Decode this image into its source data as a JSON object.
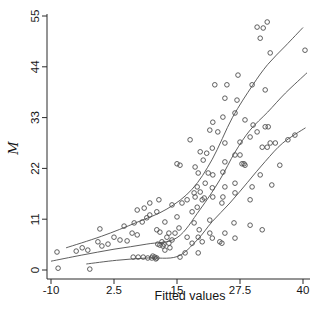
{
  "chart_data": {
    "type": "scatter",
    "title": "",
    "xlabel": "Fitted values",
    "ylabel": "M",
    "xlim": [
      -10,
      40
    ],
    "ylim": [
      0,
      55
    ],
    "x_ticks": [
      -10,
      2.5,
      15,
      27.5,
      40
    ],
    "x_tick_labels": [
      "-10",
      "2.5",
      "15",
      "27.5",
      "40"
    ],
    "y_ticks": [
      0,
      11,
      22,
      33,
      44,
      55
    ],
    "y_tick_labels": [
      "0",
      "11",
      "22",
      "33",
      "44",
      "55"
    ],
    "grid": false,
    "legend_position": "none",
    "marker_shape": "open-circle",
    "marker_color": "#4d4d4d",
    "line_color": "#4d4d4d",
    "axis_color": "#2b2b2b",
    "background_color": "#ffffff",
    "points": [
      [
        -8.8,
        3.9
      ],
      [
        -8.6,
        0.4
      ],
      [
        -5.0,
        4.1
      ],
      [
        -3.8,
        4.8
      ],
      [
        -2.7,
        4.3
      ],
      [
        -2.3,
        0.2
      ],
      [
        -0.7,
        6.1
      ],
      [
        -0.3,
        8.9
      ],
      [
        0.1,
        5.2
      ],
      [
        1.3,
        5.6
      ],
      [
        2.5,
        7.1
      ],
      [
        3.7,
        6.5
      ],
      [
        4.5,
        9.5
      ],
      [
        5.1,
        6.3
      ],
      [
        6.1,
        8.0
      ],
      [
        6.3,
        2.8
      ],
      [
        6.5,
        10.2
      ],
      [
        7.1,
        7.6
      ],
      [
        7.1,
        13.0
      ],
      [
        7.3,
        2.8
      ],
      [
        8.1,
        10.4
      ],
      [
        8.3,
        2.8
      ],
      [
        8.5,
        13.4
      ],
      [
        9.0,
        11.3
      ],
      [
        9.2,
        2.6
      ],
      [
        9.6,
        11.9
      ],
      [
        9.6,
        14.5
      ],
      [
        10.0,
        2.6
      ],
      [
        10.2,
        3.0
      ],
      [
        10.6,
        2.8
      ],
      [
        10.8,
        2.4
      ],
      [
        11.0,
        2.6
      ],
      [
        11.0,
        8.7
      ],
      [
        11.0,
        12.6
      ],
      [
        11.2,
        5.6
      ],
      [
        11.4,
        15.2
      ],
      [
        11.6,
        5.4
      ],
      [
        11.6,
        8.2
      ],
      [
        12.0,
        6.1
      ],
      [
        12.2,
        5.2
      ],
      [
        12.4,
        5.6
      ],
      [
        12.6,
        4.3
      ],
      [
        12.6,
        10.4
      ],
      [
        13.0,
        7.1
      ],
      [
        13.4,
        5.8
      ],
      [
        13.4,
        8.0
      ],
      [
        13.6,
        4.8
      ],
      [
        14.0,
        6.5
      ],
      [
        14.0,
        14.1
      ],
      [
        14.6,
        8.0
      ],
      [
        15.0,
        11.5
      ],
      [
        15.0,
        23.0
      ],
      [
        15.4,
        9.1
      ],
      [
        15.6,
        2.8
      ],
      [
        15.6,
        22.7
      ],
      [
        16.0,
        14.5
      ],
      [
        16.6,
        3.7
      ],
      [
        17.0,
        7.1
      ],
      [
        17.0,
        15.2
      ],
      [
        17.6,
        28.2
      ],
      [
        18.0,
        5.8
      ],
      [
        18.0,
        12.6
      ],
      [
        18.4,
        10.2
      ],
      [
        18.4,
        16.7
      ],
      [
        18.6,
        15.8
      ],
      [
        18.6,
        22.3
      ],
      [
        19.0,
        13.6
      ],
      [
        19.0,
        18.0
      ],
      [
        19.2,
        3.7
      ],
      [
        19.2,
        7.1
      ],
      [
        19.2,
        21.0
      ],
      [
        19.4,
        8.7
      ],
      [
        19.6,
        16.9
      ],
      [
        19.6,
        25.6
      ],
      [
        20.0,
        6.1
      ],
      [
        20.0,
        15.2
      ],
      [
        20.4,
        15.6
      ],
      [
        20.2,
        23.8
      ],
      [
        20.6,
        18.8
      ],
      [
        20.9,
        25.3
      ],
      [
        21.2,
        21.0
      ],
      [
        21.5,
        8.0
      ],
      [
        21.5,
        10.8
      ],
      [
        21.5,
        30.3
      ],
      [
        22.0,
        6.9
      ],
      [
        22.0,
        17.8
      ],
      [
        22.0,
        26.4
      ],
      [
        22.1,
        15.8
      ],
      [
        22.1,
        20.6
      ],
      [
        22.1,
        32.0
      ],
      [
        22.5,
        40.1
      ],
      [
        23.1,
        29.9
      ],
      [
        23.5,
        6.1
      ],
      [
        23.9,
        5.8
      ],
      [
        23.9,
        14.5
      ],
      [
        24.1,
        15.8
      ],
      [
        24.1,
        21.2
      ],
      [
        24.1,
        33.1
      ],
      [
        24.5,
        8.0
      ],
      [
        24.5,
        18.0
      ],
      [
        24.5,
        23.4
      ],
      [
        24.5,
        27.5
      ],
      [
        24.5,
        37.2
      ],
      [
        24.9,
        40.1
      ],
      [
        26.3,
        10.2
      ],
      [
        26.5,
        6.9
      ],
      [
        26.5,
        16.7
      ],
      [
        26.5,
        18.8
      ],
      [
        26.5,
        24.9
      ],
      [
        26.5,
        34.0
      ],
      [
        26.9,
        36.8
      ],
      [
        27.1,
        42.2
      ],
      [
        27.5,
        24.9
      ],
      [
        27.5,
        27.7
      ],
      [
        27.9,
        23.0
      ],
      [
        28.3,
        23.0
      ],
      [
        28.5,
        22.7
      ],
      [
        28.5,
        32.5
      ],
      [
        29.5,
        9.7
      ],
      [
        29.5,
        15.2
      ],
      [
        29.5,
        28.8
      ],
      [
        29.9,
        18.0
      ],
      [
        29.9,
        40.1
      ],
      [
        30.1,
        31.4
      ],
      [
        30.9,
        29.9
      ],
      [
        30.9,
        52.6
      ],
      [
        31.5,
        20.6
      ],
      [
        31.5,
        50.2
      ],
      [
        31.9,
        8.7
      ],
      [
        31.9,
        26.6
      ],
      [
        32.1,
        52.4
      ],
      [
        32.5,
        31.0
      ],
      [
        32.5,
        39.0
      ],
      [
        32.9,
        26.6
      ],
      [
        32.9,
        53.7
      ],
      [
        33.1,
        31.0
      ],
      [
        33.5,
        27.5
      ],
      [
        33.5,
        47.0
      ],
      [
        33.8,
        18.4
      ],
      [
        34.5,
        27.5
      ],
      [
        35.4,
        22.7
      ],
      [
        37.0,
        28.2
      ],
      [
        38.4,
        29.2
      ],
      [
        40.4,
        47.6
      ]
    ],
    "curves": [
      {
        "name": "upper-fit",
        "points": [
          [
            -7.0,
            4.8
          ],
          [
            0.0,
            7.3
          ],
          [
            7.0,
            10.3
          ],
          [
            13.0,
            13.2
          ],
          [
            18.0,
            17.5
          ],
          [
            22.0,
            24.0
          ],
          [
            26.0,
            33.0
          ],
          [
            30.0,
            40.0
          ],
          [
            33.0,
            44.5
          ],
          [
            36.5,
            48.5
          ],
          [
            40.0,
            52.5
          ]
        ]
      },
      {
        "name": "middle-fit",
        "points": [
          [
            -10.0,
            1.9
          ],
          [
            -4.0,
            3.2
          ],
          [
            2.5,
            4.5
          ],
          [
            9.0,
            5.6
          ],
          [
            15.0,
            7.0
          ],
          [
            19.5,
            13.0
          ],
          [
            23.5,
            19.5
          ],
          [
            26.5,
            25.5
          ],
          [
            29.5,
            30.3
          ],
          [
            33.0,
            34.2
          ],
          [
            36.5,
            38.3
          ],
          [
            40.8,
            42.7
          ]
        ]
      },
      {
        "name": "lower-fit",
        "points": [
          [
            -3.0,
            1.3
          ],
          [
            3.0,
            2.1
          ],
          [
            9.0,
            2.6
          ],
          [
            15.0,
            2.9
          ],
          [
            19.0,
            6.5
          ],
          [
            22.0,
            10.5
          ],
          [
            25.5,
            14.5
          ],
          [
            29.0,
            19.0
          ],
          [
            32.5,
            23.5
          ],
          [
            36.0,
            27.5
          ],
          [
            40.5,
            30.8
          ]
        ]
      }
    ]
  }
}
